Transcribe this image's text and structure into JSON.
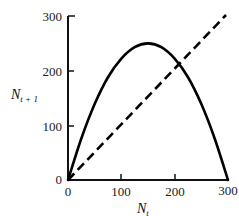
{
  "chart_data": {
    "type": "line",
    "title": "",
    "xlabel": "N_t",
    "ylabel": "N_{t+1}",
    "xlim": [
      0,
      300
    ],
    "ylim": [
      0,
      300
    ],
    "xticks": [
      0,
      100,
      200,
      300
    ],
    "yticks": [
      0,
      100,
      200,
      300
    ],
    "grid": false,
    "legend": null,
    "series": [
      {
        "name": "recruitment curve",
        "style": "solid",
        "x": [
          0,
          25,
          50,
          75,
          100,
          125,
          150,
          175,
          200,
          225,
          250,
          275,
          300
        ],
        "y": [
          0,
          76,
          139,
          188,
          222,
          243,
          250,
          243,
          222,
          188,
          139,
          76,
          0
        ]
      },
      {
        "name": "replacement line (N_{t+1} = N_t)",
        "style": "dashed",
        "x": [
          0,
          300
        ],
        "y": [
          0,
          300
        ]
      }
    ],
    "annotations": []
  },
  "labels": {
    "x_main": "N",
    "x_sub": "t",
    "y_main": "N",
    "y_sub": "t + 1",
    "xtick_labels": [
      "0",
      "100",
      "200",
      "300"
    ],
    "ytick_labels": [
      "0",
      "100",
      "200",
      "300"
    ]
  }
}
